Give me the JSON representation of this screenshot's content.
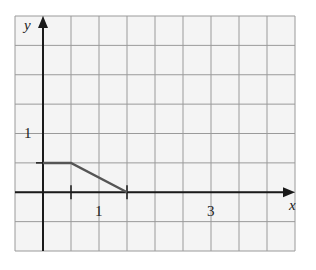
{
  "chart_data": {
    "type": "line",
    "title": "",
    "xlabel": "x",
    "ylabel": "y",
    "x_ticks_labeled": [
      1,
      3
    ],
    "y_ticks_labeled": [
      1
    ],
    "xlim": [
      -1,
      9
    ],
    "ylim": [
      -2,
      6
    ],
    "grid": true,
    "legend": null,
    "series": [
      {
        "name": "piecewise",
        "points": [
          [
            0,
            1
          ],
          [
            1,
            1
          ],
          [
            3,
            0
          ]
        ]
      }
    ],
    "annotations": []
  },
  "labels": {
    "x_axis": "x",
    "y_axis": "y",
    "x_tick_1": "1",
    "x_tick_3": "3",
    "y_tick_1": "1"
  },
  "colors": {
    "background": "#f4f4f4",
    "grid_major": "#9a9a9a",
    "grid_minor": "#bdbdbd",
    "axis": "#1a1a1a",
    "curve": "#555555"
  }
}
